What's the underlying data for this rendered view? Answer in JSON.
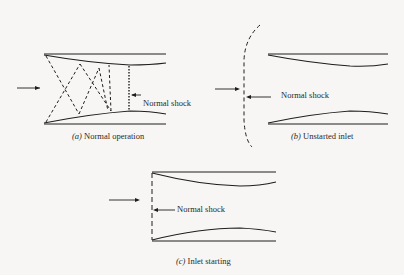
{
  "figure": {
    "panels": [
      {
        "id": "a",
        "letter": "(a)",
        "caption": "Normal operation",
        "shock_label": "Normal shock"
      },
      {
        "id": "b",
        "letter": "(b)",
        "caption": "Unstarted inlet",
        "shock_label": "Normal shock"
      },
      {
        "id": "c",
        "letter": "(c)",
        "caption": "Inlet starting",
        "shock_label": "Normal shock"
      }
    ]
  }
}
